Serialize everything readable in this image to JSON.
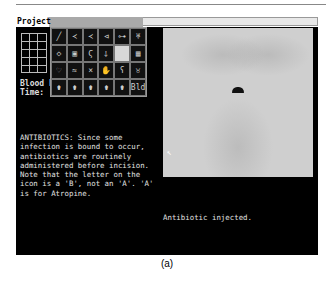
{
  "menu": {
    "project_label": "Project"
  },
  "vitals": {
    "blood_pressure_label": "Blood P",
    "time_label": "Time:"
  },
  "tool_palette": {
    "tools": [
      {
        "icon": "scalpel-icon",
        "glyph": "╱"
      },
      {
        "icon": "forceps-icon",
        "glyph": "≺"
      },
      {
        "icon": "clamp-icon",
        "glyph": "≺"
      },
      {
        "icon": "retractor-icon",
        "glyph": "⊲"
      },
      {
        "icon": "bone-icon",
        "glyph": "⊶"
      },
      {
        "icon": "scissors-icon",
        "glyph": "♅"
      },
      {
        "icon": "sponge-icon",
        "glyph": "◇"
      },
      {
        "icon": "gauze-icon",
        "glyph": "▣"
      },
      {
        "icon": "suture-icon",
        "glyph": "Ϛ"
      },
      {
        "icon": "syringe-icon",
        "glyph": "⸸"
      },
      {
        "icon": "empty-slot-icon",
        "glyph": ""
      },
      {
        "icon": "grid-icon",
        "glyph": "▦"
      },
      {
        "icon": "heart-icon",
        "glyph": "♡"
      },
      {
        "icon": "tube-icon",
        "glyph": "≈"
      },
      {
        "icon": "needle-icon",
        "glyph": "×"
      },
      {
        "icon": "hand-icon",
        "glyph": "✋"
      },
      {
        "icon": "hook-icon",
        "glyph": "ʕ"
      },
      {
        "icon": "organ-icon",
        "glyph": "♉"
      },
      {
        "icon": "drug-a-icon",
        "glyph": "⚱"
      },
      {
        "icon": "drug-b-icon",
        "glyph": "⚱"
      },
      {
        "icon": "drug-c-icon",
        "glyph": "⚱"
      },
      {
        "icon": "drug-d-icon",
        "glyph": "⚱"
      },
      {
        "icon": "drug-e-icon",
        "glyph": "⚱"
      },
      {
        "icon": "blood-icon",
        "glyph": "Bld"
      }
    ],
    "selected_index": 10
  },
  "info_text": "ANTIBIOTICS: Since some\ninfection is bound to occur,\nantibiotics are routinely\nadministered before incision.\nNote that the letter on the\nicon is a 'B', not an 'A'. 'A'\nis for Atropine.",
  "status_message": "Antibiotic injected.",
  "caption": "(a)"
}
